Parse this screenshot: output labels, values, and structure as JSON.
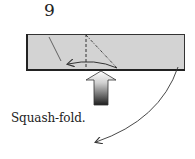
{
  "step": {
    "number": "9",
    "instruction": "Squash-fold."
  },
  "diagram": {
    "paper_fill": "#d3d3d3",
    "paper_edge": "#222222",
    "line_color": "#333333",
    "push_arrow_gradient": [
      "#ffffff",
      "#222222"
    ],
    "elements": [
      "paper-strip",
      "valley-fold-line",
      "mountain-fold-line",
      "existing-crease",
      "fold-direction-arrow",
      "push-arrow",
      "turn-over-arrow"
    ]
  }
}
